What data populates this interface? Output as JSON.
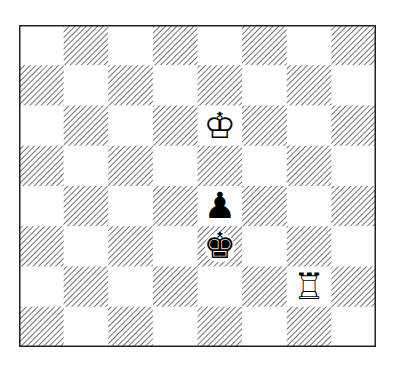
{
  "diagram": {
    "type": "chess-position",
    "files": [
      "a",
      "b",
      "c",
      "d",
      "e",
      "f",
      "g",
      "h"
    ],
    "ranks": [
      "8",
      "7",
      "6",
      "5",
      "4",
      "3",
      "2",
      "1"
    ],
    "light_square_color": "#ffffff",
    "dark_square_style": "diagonal-hatch",
    "hatch_color": "#444444",
    "border_color": "#222222",
    "pieces": [
      {
        "square": "e6",
        "color": "white",
        "type": "king",
        "glyph": "♔",
        "icon": "white-king-icon"
      },
      {
        "square": "e4",
        "color": "black",
        "type": "pawn",
        "glyph": "♟",
        "icon": "black-pawn-icon"
      },
      {
        "square": "e3",
        "color": "black",
        "type": "king",
        "glyph": "♚",
        "icon": "black-king-icon"
      },
      {
        "square": "g2",
        "color": "white",
        "type": "rook",
        "glyph": "♖",
        "icon": "white-rook-icon"
      }
    ]
  }
}
